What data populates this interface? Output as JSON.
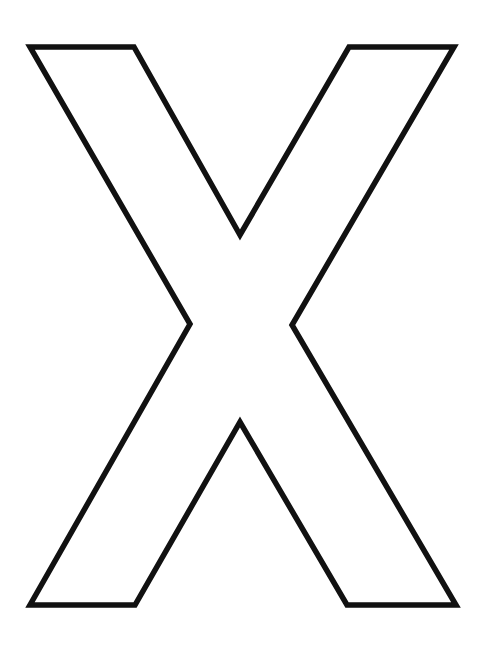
{
  "figure": {
    "glyph": "X",
    "style": "outline",
    "background_color": "#ffffff",
    "fill_color": "#ffffff",
    "stroke_color": "#111111",
    "stroke_width": 5.5,
    "outline_points": "30,47 134,47 240,235 349,47 454,47 292,325 456,605 347,605 240,422 135,605 30,605 190,324"
  }
}
